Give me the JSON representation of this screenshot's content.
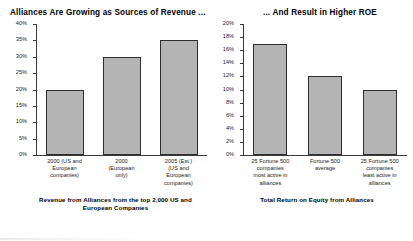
{
  "chart_data": [
    {
      "type": "bar",
      "title": "Alliances Are Growing as Sources of Revenue ...",
      "caption": "Revenue from Alliances from the top 2,000 US and European Companies",
      "xlabel": "",
      "ylabel": "",
      "ylim": [
        0,
        40
      ],
      "grid": false,
      "legend": "none",
      "bar_color": "#b4b4b4",
      "bar_border_color": "#2e2e2e",
      "yticks": [
        "40%",
        "35%",
        "30%",
        "25%",
        "20%",
        "15%",
        "10%",
        "5%",
        "0%"
      ],
      "ytick_values": [
        40,
        35,
        30,
        25,
        20,
        15,
        10,
        5,
        0
      ],
      "categories": [
        "2000 (US and European companies)",
        "2000 (European only)",
        "2005 (Est.) (US and European companies)"
      ],
      "category_lines": [
        [
          "2000 (US and",
          "European",
          "companies)"
        ],
        [
          "2000",
          "(European",
          "only)"
        ],
        [
          "2005 (Est.)",
          "(US and",
          "European",
          "companies)"
        ]
      ],
      "values": [
        20,
        30,
        35
      ]
    },
    {
      "type": "bar",
      "title": "... And Result in Higher ROE",
      "caption": "Total Return on Equity from Alliances",
      "xlabel": "",
      "ylabel": "",
      "ylim": [
        0,
        20
      ],
      "grid": false,
      "legend": "none",
      "bar_color": "#b4b4b4",
      "bar_border_color": "#2e2e2e",
      "yticks": [
        "20%",
        "18%",
        "16%",
        "14%",
        "12%",
        "10%",
        "8%",
        "6%",
        "4%",
        "2%",
        "0%"
      ],
      "ytick_values": [
        20,
        18,
        16,
        14,
        12,
        10,
        8,
        6,
        4,
        2,
        0
      ],
      "categories": [
        "25 Fortune 500 companies most active in alliances",
        "Fortune 500 average",
        "25 Fortune 500 companies least active in alliances"
      ],
      "category_lines": [
        [
          "25 Fortune 500",
          "companies",
          "most active in",
          "alliances"
        ],
        [
          "Fortune 500",
          "average"
        ],
        [
          "25 Fortune 500",
          "companies",
          "least active in",
          "alliances"
        ]
      ],
      "values": [
        17,
        12,
        10
      ]
    }
  ]
}
